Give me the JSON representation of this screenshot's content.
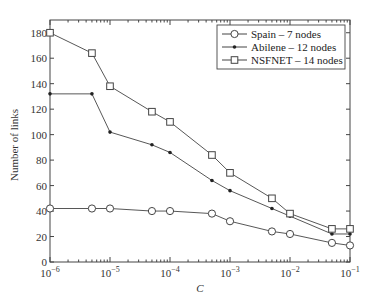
{
  "chart_data": {
    "type": "line",
    "title": "",
    "xlabel": "C",
    "ylabel": "Number of links",
    "xscale": "log",
    "xlim": [
      1e-06,
      0.1
    ],
    "ylim": [
      0,
      190
    ],
    "x": [
      1e-06,
      5e-06,
      1e-05,
      5e-05,
      0.0001,
      0.0005,
      0.001,
      0.005,
      0.01,
      0.05,
      0.1
    ],
    "x_tick_labels": [
      {
        "base": "10",
        "exp": "−6"
      },
      {
        "base": "10",
        "exp": "−5"
      },
      {
        "base": "10",
        "exp": "−4"
      },
      {
        "base": "10",
        "exp": "−3"
      },
      {
        "base": "10",
        "exp": "−2"
      },
      {
        "base": "10",
        "exp": "−1"
      }
    ],
    "y_ticks": [
      0,
      20,
      40,
      60,
      80,
      100,
      120,
      140,
      160,
      180
    ],
    "grid": false,
    "legend_position": "upper right",
    "series": [
      {
        "name": "Spain – 7 nodes",
        "marker": "circle",
        "values": [
          42,
          42,
          42,
          40,
          40,
          38,
          32,
          24,
          22,
          15,
          13
        ]
      },
      {
        "name": "Abilene – 12 nodes",
        "marker": "dot",
        "values": [
          132,
          132,
          102,
          92,
          86,
          64,
          56,
          42,
          36,
          22,
          22
        ]
      },
      {
        "name": "NSFNET – 14 nodes",
        "marker": "square",
        "values": [
          180,
          164,
          138,
          118,
          110,
          84,
          70,
          50,
          38,
          26,
          26
        ]
      }
    ]
  }
}
